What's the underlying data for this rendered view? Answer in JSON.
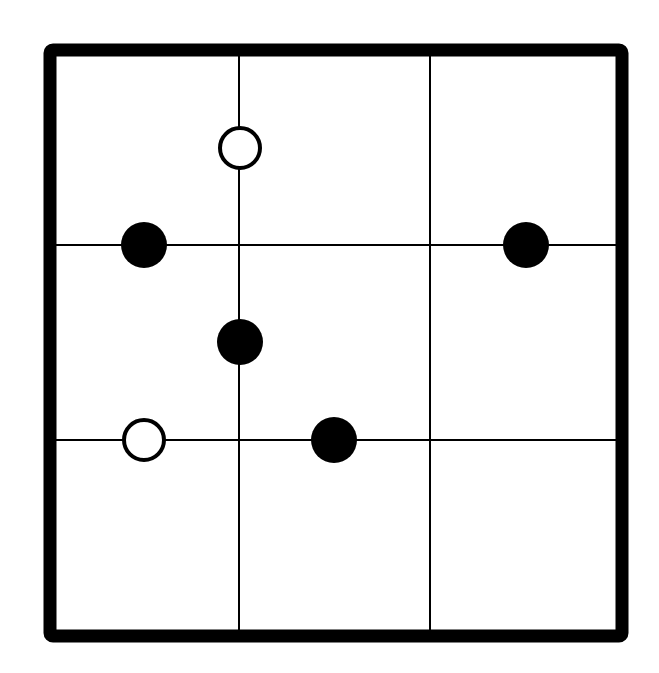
{
  "puzzle": {
    "type": "masyu-style grid",
    "grid": {
      "rows": 3,
      "cols": 3
    },
    "frame": {
      "x": 50,
      "y": 50,
      "width": 572,
      "height": 586,
      "stroke_width": 13,
      "color": "#000000"
    },
    "vertical_lines_x": [
      239,
      430
    ],
    "horizontal_lines_y": [
      245,
      440
    ],
    "line_color": "#000000",
    "background": "#ffffff",
    "circles": [
      {
        "cx": 240,
        "cy": 148,
        "r": 22,
        "fill": "white"
      },
      {
        "cx": 144,
        "cy": 245,
        "r": 23,
        "fill": "black"
      },
      {
        "cx": 526,
        "cy": 245,
        "r": 23,
        "fill": "black"
      },
      {
        "cx": 240,
        "cy": 342,
        "r": 23,
        "fill": "black"
      },
      {
        "cx": 144,
        "cy": 440,
        "r": 22,
        "fill": "white"
      },
      {
        "cx": 334,
        "cy": 440,
        "r": 23,
        "fill": "black"
      }
    ]
  }
}
